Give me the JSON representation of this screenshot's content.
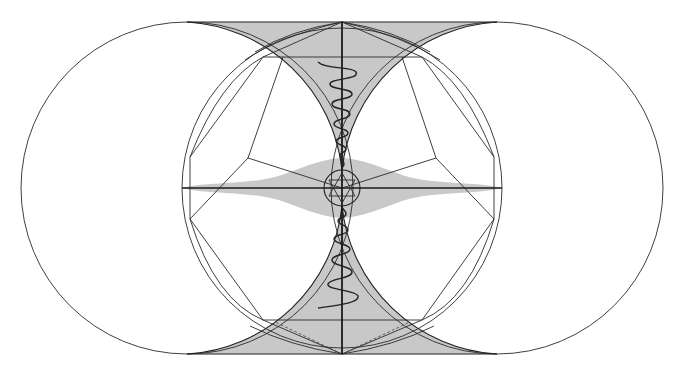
{
  "diagram": {
    "title": "Sacred geometry: two tangent circles with vesica-like shaded region, central circle, polygon, hexagram and spirals",
    "colors": {
      "background": "#ffffff",
      "line": "#222222",
      "shade": "#c8c8c8",
      "wave": "#c9c9c9"
    },
    "elements": {
      "left_circle": {
        "cx": 187,
        "cy": 188,
        "r": 166
      },
      "right_circle": {
        "cx": 497,
        "cy": 188,
        "r": 166
      },
      "central_circle": {
        "cx": 342,
        "cy": 188,
        "r": 160
      },
      "inner_circle": {
        "cx": 342,
        "cy": 188,
        "r": 18
      },
      "top_line_y": 25,
      "bottom_line_y": 354,
      "horizontal_axis_y": 188,
      "vertical_axis_x": 342
    },
    "labels": []
  }
}
